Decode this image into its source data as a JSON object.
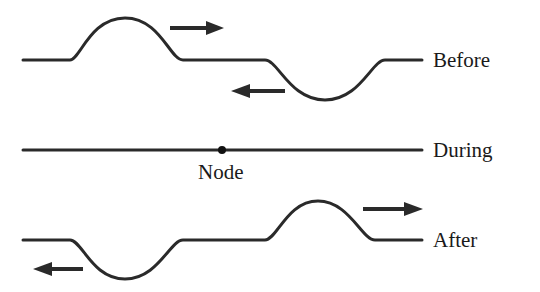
{
  "diagram": {
    "type": "wave-pulse-interference",
    "rows": [
      {
        "id": "before",
        "label": "Before",
        "pulses": [
          {
            "shape": "crest",
            "direction": "right"
          },
          {
            "shape": "trough",
            "direction": "left"
          }
        ]
      },
      {
        "id": "during",
        "label": "During",
        "annotation": "Node"
      },
      {
        "id": "after",
        "label": "After",
        "pulses": [
          {
            "shape": "trough",
            "direction": "left"
          },
          {
            "shape": "crest",
            "direction": "right"
          }
        ]
      }
    ],
    "colors": {
      "stroke": "#2a2a2a",
      "text": "#1a1a1a",
      "background": "#ffffff"
    }
  }
}
